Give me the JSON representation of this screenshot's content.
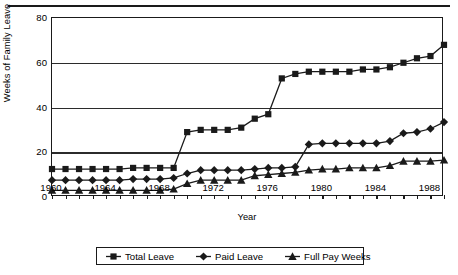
{
  "chart_data": {
    "type": "line",
    "title": "",
    "xlabel": "Year",
    "ylabel": "Weeks of Family Leave",
    "xlim": [
      1960,
      1989
    ],
    "ylim": [
      0,
      80
    ],
    "grid": true,
    "legend_position": "bottom",
    "y_ticks": [
      0,
      20,
      40,
      60,
      80
    ],
    "y_tick_labels": [
      "0",
      "20",
      "40",
      "60",
      "80"
    ],
    "x_ticks": [
      1960,
      1961,
      1962,
      1963,
      1964,
      1965,
      1966,
      1967,
      1968,
      1969,
      1970,
      1971,
      1972,
      1973,
      1974,
      1975,
      1976,
      1977,
      1978,
      1979,
      1980,
      1981,
      1982,
      1983,
      1984,
      1985,
      1986,
      1987,
      1988,
      1989
    ],
    "x_tick_labels": [
      "1960",
      "1964",
      "1968",
      "1972",
      "1976",
      "1980",
      "1984",
      "1988"
    ],
    "x_labeled_years": [
      1960,
      1964,
      1968,
      1972,
      1976,
      1980,
      1984,
      1988
    ],
    "x": [
      1960,
      1961,
      1962,
      1963,
      1964,
      1965,
      1966,
      1967,
      1968,
      1969,
      1970,
      1971,
      1972,
      1973,
      1974,
      1975,
      1976,
      1977,
      1978,
      1979,
      1980,
      1981,
      1982,
      1983,
      1984,
      1985,
      1986,
      1987,
      1988,
      1989
    ],
    "series": [
      {
        "name": "Total Leave",
        "marker": "square",
        "values": [
          12.5,
          12.5,
          12.5,
          12.5,
          12.5,
          12.5,
          13,
          13,
          13,
          13,
          29,
          30,
          30,
          30,
          31,
          35,
          37,
          53,
          55,
          56,
          56,
          56,
          56,
          57,
          57,
          58,
          60,
          62,
          63,
          68
        ]
      },
      {
        "name": "Paid Leave",
        "marker": "diamond",
        "values": [
          7.5,
          7.5,
          7.5,
          7.5,
          7.5,
          7.5,
          8,
          8,
          8,
          8.5,
          10.5,
          12,
          12,
          12,
          12,
          12.5,
          13,
          13,
          13.5,
          23.5,
          24,
          24,
          24,
          24,
          24,
          25,
          28.5,
          29,
          30.5,
          33.5
        ]
      },
      {
        "name": "Full Pay Weeks",
        "marker": "triangle",
        "values": [
          3,
          3,
          3,
          3,
          3,
          3,
          3,
          3,
          3,
          3.5,
          6,
          7.5,
          7.5,
          7.5,
          7.5,
          9.5,
          10,
          10.5,
          11,
          12,
          12.5,
          12.5,
          13,
          13,
          13,
          14,
          16,
          16,
          16,
          16.5
        ]
      }
    ],
    "colors": {
      "line": "#1a1a1a",
      "grid": "#2b2b2b",
      "background": "#ffffff"
    }
  },
  "legend": {
    "items": [
      {
        "label": "Total Leave",
        "marker": "square"
      },
      {
        "label": "Paid Leave",
        "marker": "diamond"
      },
      {
        "label": "Full Pay Weeks",
        "marker": "triangle"
      }
    ]
  }
}
